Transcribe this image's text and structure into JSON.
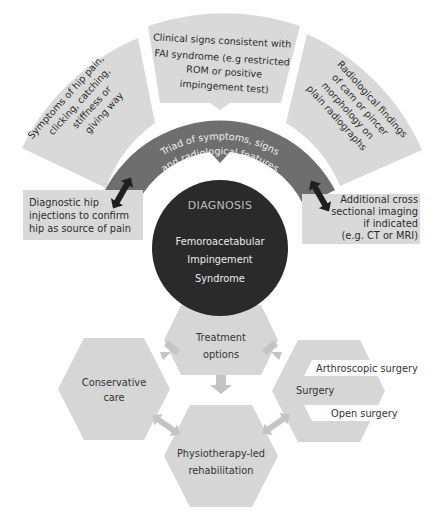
{
  "colors": {
    "outer_segment": "#d9d9d9",
    "inner_arc": "#6e6e6e",
    "circle": "#2a2a2a",
    "side_box": "#d9d9d9",
    "double_arrow": "#1f1f1f",
    "hexagon": "#d6d6d6",
    "hex_arrow": "#c4c4c4"
  },
  "outer_segments": [
    {
      "id": "symptoms",
      "lines": [
        "Symptoms of hip pain,",
        "clicking, catching,",
        "stiffness or",
        "giving way"
      ]
    },
    {
      "id": "clinical-signs",
      "lines": [
        "Clinical signs consistent with",
        "FAI syndrome (e.g restricted",
        "ROM or positive",
        "impingement test)"
      ]
    },
    {
      "id": "radiological",
      "lines": [
        "Radiological findings",
        "of cam or pincer",
        "morphology on",
        "plain radiographs"
      ]
    }
  ],
  "inner_arc": {
    "lines": [
      "Triad of symptoms, signs",
      "and radiological features"
    ]
  },
  "left_box": {
    "lines": [
      "Diagnostic hip",
      "injections to confirm",
      "hip as source of pain"
    ]
  },
  "right_box": {
    "lines": [
      "Additional cross",
      "sectional imaging",
      "if indicated",
      "(e.g. CT or MRI)"
    ]
  },
  "diagnosis": {
    "title": "DIAGNOSIS",
    "lines": [
      "Femoroacetabular",
      "Impingement",
      "Syndrome"
    ]
  },
  "treatment": {
    "lines": [
      "Treatment",
      "options"
    ]
  },
  "conservative": {
    "lines": [
      "Conservative",
      "care"
    ]
  },
  "surgery": {
    "label": "Surgery",
    "options": [
      "Arthroscopic surgery",
      "Open surgery"
    ]
  },
  "physio": {
    "lines": [
      "Physiotherapy-led",
      "rehabilitation"
    ]
  }
}
